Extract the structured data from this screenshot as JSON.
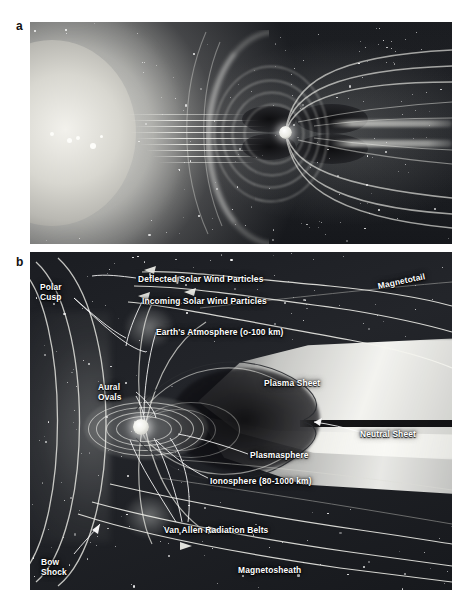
{
  "figure": {
    "panels": [
      {
        "letter": "a",
        "caption": ""
      },
      {
        "letter": "b",
        "caption": ""
      }
    ]
  },
  "panel_a": {
    "letter": "a",
    "description": "Artist rendering of the Sun emitting solar wind toward Earth's magnetosphere",
    "objects": [
      "sun",
      "solar-wind-streams",
      "bow-shock",
      "earth",
      "magnetic-field-lines",
      "magnetotail",
      "starfield"
    ]
  },
  "panel_b": {
    "letter": "b",
    "labels": [
      {
        "id": "polar-cusp",
        "text": "Polar\nCusp",
        "x": 10,
        "y": 30,
        "rotate": 0
      },
      {
        "id": "deflected-solar-wind",
        "text": "Deflected Solar Wind Particles",
        "x": 108,
        "y": 22,
        "rotate": 0
      },
      {
        "id": "incoming-solar-wind",
        "text": "Incoming Solar Wind Particles",
        "x": 112,
        "y": 44,
        "rotate": 0
      },
      {
        "id": "magnetotail",
        "text": "Magnetotail",
        "x": 348,
        "y": 29,
        "rotate": -12
      },
      {
        "id": "earths-atmosphere",
        "text": "Earth's Atmosphere (o-100 km)",
        "x": 126,
        "y": 75,
        "rotate": 0
      },
      {
        "id": "plasma-sheet",
        "text": "Plasma Sheet",
        "x": 234,
        "y": 126,
        "rotate": 0
      },
      {
        "id": "aural-ovals",
        "text": "Aural\nOvals",
        "x": 68,
        "y": 130,
        "rotate": 0
      },
      {
        "id": "neutral-sheet",
        "text": "Neutral Sheet",
        "x": 330,
        "y": 177,
        "rotate": 0
      },
      {
        "id": "plasmasphere",
        "text": "Plasmasphere",
        "x": 220,
        "y": 198,
        "rotate": 0
      },
      {
        "id": "ionosphere",
        "text": "Ionosphere (80-1000 km)",
        "x": 180,
        "y": 224,
        "rotate": 0
      },
      {
        "id": "van-allen-belts",
        "text": "Van Allen Radiation Belts",
        "x": 134,
        "y": 273,
        "rotate": 0
      },
      {
        "id": "bow-shock",
        "text": "Bow\nShock",
        "x": 11,
        "y": 305,
        "rotate": 0
      },
      {
        "id": "magnetosheath",
        "text": "Magnetosheath",
        "x": 208,
        "y": 313,
        "rotate": 0
      }
    ]
  },
  "colors": {
    "background": "#ffffff",
    "space": "#1b1d22",
    "label_text": "#ffffff",
    "plasma_bright": "#fbfbf7",
    "field_line": "#f6f6f0"
  }
}
